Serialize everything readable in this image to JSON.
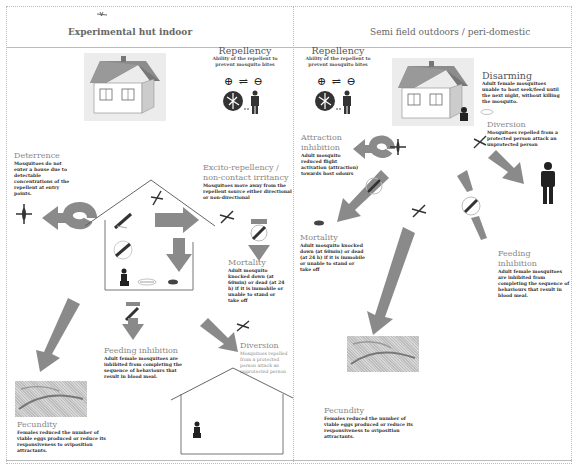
{
  "sections": {
    "left": {
      "title": "Experimental hut indoor"
    },
    "right": {
      "title": "Semi field  outdoors / peri-domestic"
    }
  },
  "left": {
    "repellency": {
      "title": "Repellency",
      "desc": "Ability of the repellent to prevent mosquito bites",
      "symbol": "⊕ ⇌ ⊖"
    },
    "deterrence": {
      "title": "Deterrence",
      "desc": "Mosquitoes do not enter a house due to detectable concentrations of the repellent at entry points."
    },
    "excito": {
      "title": "Excito-repellency / non-contact irritancy",
      "desc": "Mosquitoes move away from the repellent source either directional or non-directional"
    },
    "mortality": {
      "title": "Mortality",
      "desc": "Adult mosquito knocked down (at 60min) or dead (at 24 h) if it is immobile or unable to stand or take off"
    },
    "feeding": {
      "title": "Feeding inhibition",
      "desc": "Adult female mosquitoes are inhibited from completing the sequence of behaviours that result in blood meal."
    },
    "diversion": {
      "title": "Diversion",
      "desc": "Mosquitoes repelled from a protected person attack an unprotected person"
    },
    "fecundity": {
      "title": "Fecundity",
      "desc": "Females reduced the number of viable eggs produced or reduce its responsiveness to oviposition attractants."
    }
  },
  "right": {
    "repellency": {
      "title": "Repellency",
      "desc": "Ability of the repellent to prevent mosquito bites",
      "symbol": "⊕ ⇌ ⊖"
    },
    "disarming": {
      "title": "Disarming",
      "desc": "Adult female mosquitoes unable to host seek/feed until the next night, without killing the mosquito."
    },
    "attraction": {
      "title": "Attraction inhibition",
      "desc": "Adult mosquito reduced flight activation (attraction) towards host odours"
    },
    "diversion": {
      "title": "Diversion",
      "desc": "Mosquitoes repelled from a protected person attack an unprotected person"
    },
    "mortality": {
      "title": "Mortality",
      "desc": "Adult mosquito knocked down (at 60min) or dead (at 24 h) if it is immobile or unable to stand or take off"
    },
    "feeding": {
      "title": "Feeding inhibition",
      "desc": "Adult female mosquitoes are inhibited from completing the sequence of behaviours that result in blood meal."
    },
    "fecundity": {
      "title": "Fecundity",
      "desc": "Females reduced the number of viable eggs produced or reduce its responsiveness to oviposition attractants."
    }
  },
  "colors": {
    "arrow": "#8a8a8a",
    "line": "#555555",
    "text_dark": "#333333",
    "text_heading": "#666666"
  }
}
